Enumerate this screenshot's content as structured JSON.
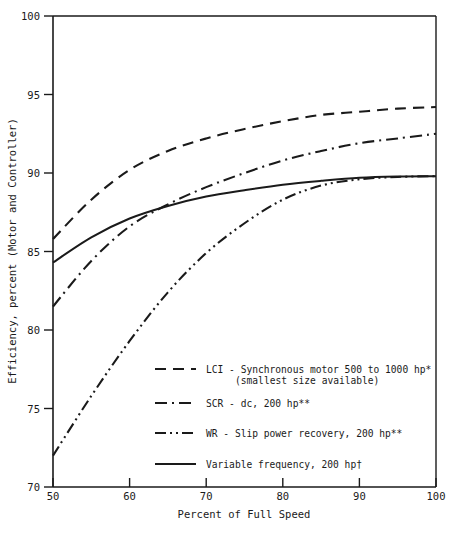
{
  "chart_data": {
    "type": "line",
    "title": "",
    "xlabel": "Percent of Full Speed",
    "ylabel": "Efficiency, percent (Motor and Controller)",
    "xlim": [
      50,
      100
    ],
    "ylim": [
      70,
      100
    ],
    "xticks": [
      50,
      60,
      70,
      80,
      90,
      100
    ],
    "yticks": [
      70,
      75,
      80,
      85,
      90,
      95,
      100
    ],
    "xtick_labels": [
      "50",
      "60",
      "70",
      "80",
      "90",
      "100"
    ],
    "ytick_labels": [
      "70",
      "75",
      "80",
      "85",
      "90",
      "95",
      "100"
    ],
    "grid": false,
    "legend_position": "inside-lower-center",
    "x": [
      50,
      55,
      60,
      65,
      70,
      75,
      80,
      85,
      90,
      95,
      100
    ],
    "series": [
      {
        "name": "lci",
        "label": "LCI - Synchronous motor 500 to 1000 hp*",
        "label_line2": "(smallest size available)",
        "dash": "dashed",
        "values": [
          85.8,
          88.3,
          90.2,
          91.4,
          92.2,
          92.8,
          93.3,
          93.7,
          93.9,
          94.1,
          94.2
        ]
      },
      {
        "name": "scr",
        "label": "SCR - dc, 200 hp**",
        "dash": "dash-dot",
        "values": [
          81.5,
          84.4,
          86.6,
          88.0,
          89.1,
          90.0,
          90.8,
          91.4,
          91.9,
          92.2,
          92.5
        ]
      },
      {
        "name": "wr",
        "label": "WR - Slip power recovery, 200 hp**",
        "dash": "dash-dot-dot",
        "values": [
          72.0,
          75.8,
          79.3,
          82.4,
          84.9,
          86.8,
          88.3,
          89.2,
          89.6,
          89.75,
          89.8
        ]
      },
      {
        "name": "variable_frequency",
        "label": "Variable frequency, 200 hp†",
        "dash": "solid",
        "values": [
          84.3,
          85.9,
          87.1,
          87.9,
          88.5,
          88.9,
          89.25,
          89.5,
          89.7,
          89.78,
          89.8
        ]
      }
    ]
  },
  "legend": {
    "entries": [
      {
        "label": "LCI - Synchronous motor 500 to 1000 hp*",
        "label2": "(smallest size available)",
        "style": "dashed"
      },
      {
        "label": "SCR - dc, 200 hp**",
        "label2": "",
        "style": "dash-dot"
      },
      {
        "label": "WR - Slip power recovery, 200 hp**",
        "label2": "",
        "style": "dash-dot-dot"
      },
      {
        "label": "Variable frequency, 200 hp†",
        "label2": "",
        "style": "solid"
      }
    ]
  },
  "colors": {
    "ink": "#1a1a1a",
    "background": "#ffffff"
  }
}
